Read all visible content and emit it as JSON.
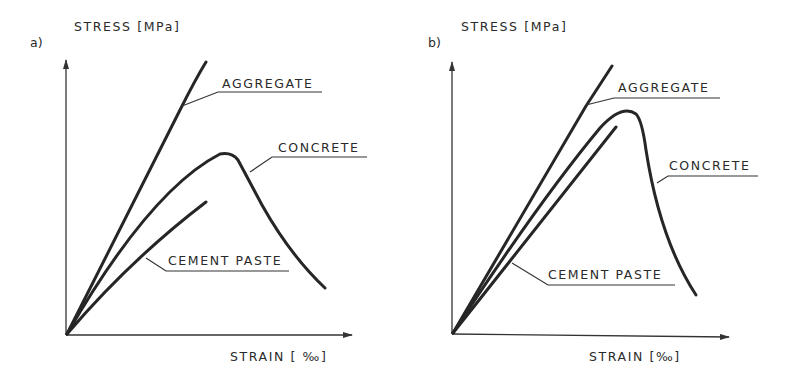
{
  "figure": {
    "panels": [
      {
        "id": "a",
        "panel_label": "a)",
        "y_axis_label": "STRESS [MPa]",
        "x_axis_label": "STRAIN [ ‰]",
        "curves": [
          {
            "name": "aggregate",
            "label": "AGGREGATE"
          },
          {
            "name": "concrete",
            "label": "CONCRETE"
          },
          {
            "name": "cement-paste",
            "label": "CEMENT PASTE"
          }
        ]
      },
      {
        "id": "b",
        "panel_label": "b)",
        "y_axis_label": "STRESS [MPa]",
        "x_axis_label": "STRAIN [‰]",
        "curves": [
          {
            "name": "aggregate",
            "label": "AGGREGATE"
          },
          {
            "name": "concrete",
            "label": "CONCRETE"
          },
          {
            "name": "cement-paste",
            "label": "CEMENT PASTE"
          }
        ]
      }
    ],
    "line_color": "#262626",
    "background": "#ffffff"
  }
}
